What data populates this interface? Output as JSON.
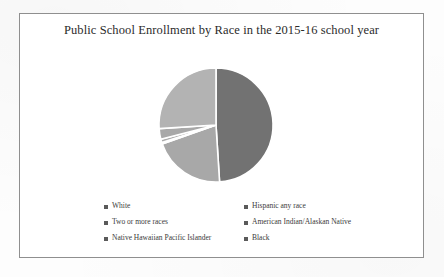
{
  "chart_data": {
    "type": "pie",
    "title": "Public School Enrollment by Race in the 2015-16 school year",
    "xlabel": "",
    "ylabel": "",
    "legend_position": "bottom",
    "grid": false,
    "categories": [
      "White",
      "Hispanic any race",
      "Two or more races",
      "American Indian/Alaskan Native",
      "Native Hawaiian Pacific Islander",
      "Black"
    ],
    "values": [
      49,
      26,
      3,
      1,
      0.4,
      20.6
    ],
    "units": "percent",
    "colors": [
      "#727272",
      "#b3b3b3",
      "#a8a8a8",
      "#ababab",
      "#aeaeae",
      "#9d9d9d"
    ],
    "slices": [
      {
        "label": "White",
        "value": 49,
        "color": "#727272"
      },
      {
        "label": "Black",
        "value": 20.6,
        "color": "#a8a8a8"
      },
      {
        "label": "Native Hawaiian Pacific Islander",
        "value": 0.4,
        "color": "#aeaeae"
      },
      {
        "label": "American Indian/Alaskan Native",
        "value": 1,
        "color": "#ababab"
      },
      {
        "label": "Two or more races",
        "value": 3,
        "color": "#a8a8a8"
      },
      {
        "label": "Hispanic any race",
        "value": 26,
        "color": "#b3b3b3"
      }
    ]
  },
  "legend": {
    "items": [
      {
        "label": "White",
        "color": "#5a5a5a"
      },
      {
        "label": "Hispanic any race",
        "color": "#5a5a5a"
      },
      {
        "label": "Two or more races",
        "color": "#5a5a5a"
      },
      {
        "label": "American Indian/Alaskan Native",
        "color": "#5a5a5a"
      },
      {
        "label": "Native Hawaiian Pacific Islander",
        "color": "#5a5a5a"
      },
      {
        "label": "Black",
        "color": "#5a5a5a"
      }
    ]
  }
}
